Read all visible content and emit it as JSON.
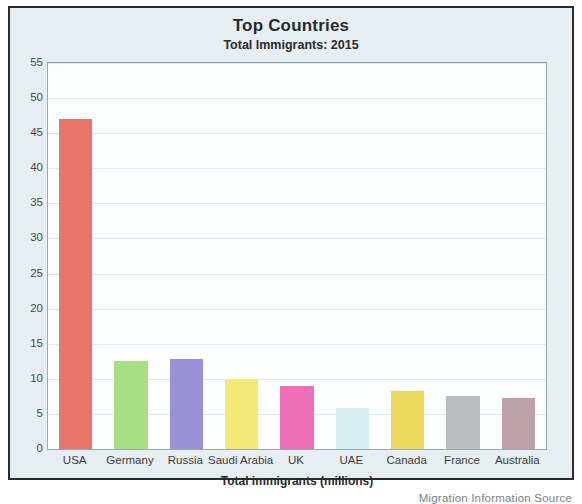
{
  "chart_data": {
    "type": "bar",
    "title": "Top Countries",
    "subtitle": "Total Immigrants: 2015",
    "xlabel": "Total immigrants (millions)",
    "ylabel": "",
    "categories": [
      "USA",
      "Germany",
      "Russia",
      "Saudi Arabia",
      "UK",
      "UAE",
      "Canada",
      "France",
      "Australia"
    ],
    "values": [
      47,
      12.5,
      12.8,
      10,
      9,
      5.8,
      8.3,
      7.6,
      7.2
    ],
    "bar_colors": [
      "#e8746a",
      "#a8e086",
      "#9a90d8",
      "#f2e878",
      "#ee6fb8",
      "#d6edf2",
      "#ebd95e",
      "#b9bcbe",
      "#bda0a8"
    ],
    "ylim": [
      0,
      55
    ],
    "yticks": [
      0,
      5,
      10,
      15,
      20,
      25,
      30,
      35,
      40,
      45,
      50,
      55
    ],
    "ytick_labels": [
      "0",
      "5",
      "10",
      "15",
      "20",
      "25",
      "30",
      "35",
      "40",
      "45",
      "50",
      "55"
    ],
    "grid": true,
    "legend": false,
    "source": "Migration Information Source",
    "figure_background": "#e6eef1",
    "plot_background": "#fdfeff"
  }
}
